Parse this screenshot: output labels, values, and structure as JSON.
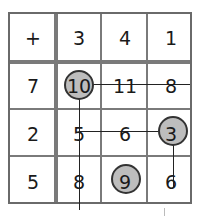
{
  "grid": {
    "operator": "+",
    "col_headers": [
      "3",
      "4",
      "1"
    ],
    "row_headers": [
      "7",
      "2",
      "5"
    ],
    "cells": [
      [
        "10",
        "11",
        "8"
      ],
      [
        "5",
        "6",
        "3"
      ],
      [
        "8",
        "9",
        "6"
      ]
    ],
    "circled": [
      [
        0,
        0
      ],
      [
        1,
        2
      ],
      [
        2,
        1
      ]
    ],
    "colors": {
      "circle_fill": "#bdbdbd",
      "grid_line": "#7a7a7a",
      "text": "#1a1a1a"
    }
  }
}
